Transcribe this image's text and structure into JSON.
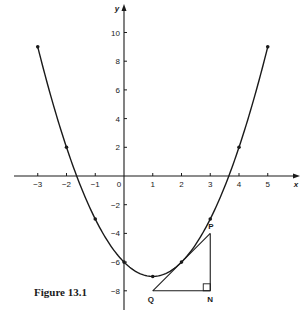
{
  "chart_data": {
    "type": "line",
    "title": "",
    "caption": "Figure 13.1",
    "xlabel": "x",
    "ylabel": "y",
    "xlim": [
      -3.5,
      5.6
    ],
    "ylim": [
      -9.4,
      11
    ],
    "x_ticks": [
      -3,
      -2,
      -1,
      0,
      1,
      2,
      3,
      4,
      5
    ],
    "y_ticks": [
      10,
      8,
      6,
      4,
      2,
      -2,
      -4,
      -6,
      -8
    ],
    "grid": false,
    "series": [
      {
        "name": "y = x^2 - 2x - 6",
        "x": [
          -3,
          -2,
          -1,
          0,
          1,
          2,
          3,
          4,
          5
        ],
        "values": [
          9,
          2,
          -3,
          -6,
          -7,
          -6,
          -3,
          2,
          9
        ]
      }
    ],
    "annotations": {
      "tangent_line": {
        "from": [
          1,
          -8
        ],
        "to": [
          3,
          -4
        ],
        "touches_at": [
          2,
          -6
        ]
      },
      "triangle": {
        "P": [
          3,
          -4
        ],
        "Q": [
          1,
          -8
        ],
        "N": [
          3,
          -8
        ],
        "right_angle_at": "N"
      },
      "labels": {
        "P": "P",
        "Q": "Q",
        "N": "N"
      }
    }
  },
  "figure": {
    "caption": "Figure 13.1",
    "x_axis_label": "x",
    "y_axis_label": "y",
    "point_labels": {
      "P": "P",
      "Q": "Q",
      "N": "N"
    },
    "line_color": "#1a1a1a",
    "background": "#ffffff"
  }
}
